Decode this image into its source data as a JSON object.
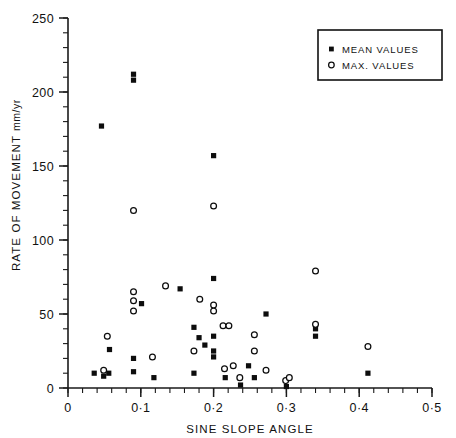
{
  "chart_data": {
    "type": "scatter",
    "title": "",
    "xlabel": "SINE SLOPE ANGLE",
    "ylabel": "RATE OF MOVEMENT",
    "ylabel_units": "mm/yr",
    "xlim": [
      0,
      0.5
    ],
    "ylim": [
      0,
      250
    ],
    "grid": false,
    "x_ticks_major": [
      "0",
      "0·1",
      "0·2",
      "0·3",
      "0·4",
      "0·5"
    ],
    "x_tick_values": [
      0,
      0.1,
      0.2,
      0.3,
      0.4,
      0.5
    ],
    "x_minor_step": 0.02,
    "y_ticks_major": [
      "0",
      "50",
      "100",
      "150",
      "200",
      "250"
    ],
    "y_tick_values": [
      0,
      50,
      100,
      150,
      200,
      250
    ],
    "y_minor_step": 10,
    "legend_position": "top-right",
    "series": [
      {
        "name": "MEAN VALUES",
        "marker": "filled-square",
        "color": "#0d0d0d",
        "points": [
          [
            0.036,
            10
          ],
          [
            0.049,
            8
          ],
          [
            0.056,
            10
          ],
          [
            0.057,
            26
          ],
          [
            0.09,
            208
          ],
          [
            0.09,
            212
          ],
          [
            0.09,
            20
          ],
          [
            0.09,
            11
          ],
          [
            0.046,
            177
          ],
          [
            0.101,
            57
          ],
          [
            0.118,
            7
          ],
          [
            0.154,
            67
          ],
          [
            0.173,
            41
          ],
          [
            0.173,
            10
          ],
          [
            0.18,
            34
          ],
          [
            0.188,
            29
          ],
          [
            0.2,
            157
          ],
          [
            0.2,
            74
          ],
          [
            0.2,
            35
          ],
          [
            0.2,
            25
          ],
          [
            0.2,
            21
          ],
          [
            0.216,
            7
          ],
          [
            0.237,
            2
          ],
          [
            0.248,
            15
          ],
          [
            0.256,
            7
          ],
          [
            0.272,
            50
          ],
          [
            0.3,
            1
          ],
          [
            0.34,
            40
          ],
          [
            0.34,
            35
          ],
          [
            0.412,
            10
          ]
        ]
      },
      {
        "name": "MAX. VALUES",
        "marker": "open-circle",
        "color": "#0d0d0d",
        "points": [
          [
            0.049,
            12
          ],
          [
            0.054,
            35
          ],
          [
            0.09,
            120
          ],
          [
            0.09,
            65
          ],
          [
            0.09,
            59
          ],
          [
            0.09,
            52
          ],
          [
            0.116,
            21
          ],
          [
            0.134,
            69
          ],
          [
            0.173,
            25
          ],
          [
            0.181,
            60
          ],
          [
            0.2,
            123
          ],
          [
            0.2,
            56
          ],
          [
            0.2,
            52
          ],
          [
            0.213,
            42
          ],
          [
            0.221,
            42
          ],
          [
            0.215,
            13
          ],
          [
            0.227,
            15
          ],
          [
            0.236,
            7
          ],
          [
            0.256,
            36
          ],
          [
            0.256,
            25
          ],
          [
            0.272,
            12
          ],
          [
            0.299,
            5
          ],
          [
            0.304,
            7
          ],
          [
            0.34,
            79
          ],
          [
            0.34,
            43
          ],
          [
            0.412,
            28
          ]
        ]
      }
    ]
  },
  "legend": {
    "entries": [
      {
        "label": "MEAN VALUES",
        "marker": "filled-square"
      },
      {
        "label": "MAX. VALUES",
        "marker": "open-circle"
      }
    ]
  }
}
